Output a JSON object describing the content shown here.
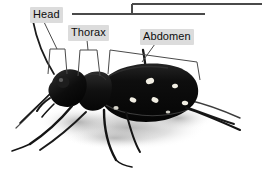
{
  "figure": {
    "background_color": "#ffffff",
    "line_color": "#4a4a4a",
    "label_background": "#dcdcdc",
    "label_text_color": "#0d0d0d",
    "beetle_body_color": "#111111",
    "beetle_spot_color": "#f2efe6",
    "shadow_color": "#c9c9c9"
  },
  "labels": [
    {
      "id": "head",
      "text": "Head",
      "x": 30,
      "y": 7
    },
    {
      "id": "thorax",
      "text": "Thorax",
      "x": 68,
      "y": 25
    },
    {
      "id": "abdomen",
      "text": "Abdomen",
      "x": 140,
      "y": 29
    }
  ],
  "rules": [
    {
      "id": "upper-rule",
      "x1": 132,
      "y1": 4,
      "x2": 262,
      "y2": 4
    },
    {
      "id": "lower-rule",
      "x1": 72,
      "y1": 14,
      "x2": 205,
      "y2": 14
    },
    {
      "id": "rule-connector",
      "x1": 132,
      "y1": 4,
      "x2": 132,
      "y2": 14
    }
  ],
  "leaders": [
    {
      "id": "head-leader",
      "x1": 44,
      "y1": 22,
      "x2": 57,
      "y2": 49
    },
    {
      "id": "thorax-leader",
      "x1": 87,
      "y1": 40,
      "x2": 88,
      "y2": 50
    },
    {
      "id": "abdomen-leader",
      "x1": 155,
      "y1": 44,
      "x2": 142,
      "y2": 62
    }
  ],
  "brackets": [
    {
      "id": "head-bracket",
      "points": "48,74 50,49 65,49 67,74"
    },
    {
      "id": "thorax-bracket",
      "points": "78,76 80,50 97,50 100,76"
    },
    {
      "id": "abdomen-bracket",
      "points": "108,74 110,50 197,62 200,80"
    }
  ]
}
